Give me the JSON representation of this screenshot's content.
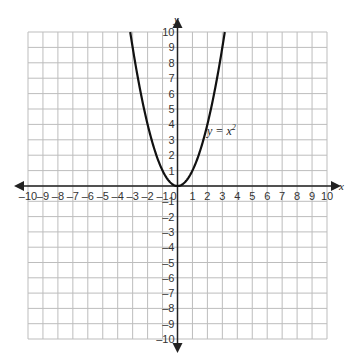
{
  "chart_data": {
    "type": "line",
    "title": "",
    "xlabel": "x",
    "ylabel": "y",
    "xlim": [
      -10,
      10
    ],
    "ylim": [
      -10,
      10
    ],
    "grid": true,
    "x_ticks": [
      -10,
      -9,
      -8,
      -7,
      -6,
      -5,
      -4,
      -3,
      -2,
      -1,
      0,
      1,
      2,
      3,
      4,
      5,
      6,
      7,
      8,
      9,
      10
    ],
    "y_ticks": [
      -10,
      -9,
      -8,
      -7,
      -6,
      -5,
      -4,
      -3,
      -2,
      -1,
      1,
      2,
      3,
      4,
      5,
      6,
      7,
      8,
      9,
      10
    ],
    "series": [
      {
        "name": "y = x^2",
        "x": [
          -3.16,
          -3,
          -2.5,
          -2,
          -1.5,
          -1,
          -0.5,
          0,
          0.5,
          1,
          1.5,
          2,
          2.5,
          3,
          3.16
        ],
        "y": [
          10,
          9,
          6.25,
          4,
          2.25,
          1,
          0.25,
          0,
          0.25,
          1,
          2.25,
          4,
          6.25,
          9,
          10
        ]
      }
    ],
    "annotations": [
      {
        "text": "y = x",
        "superscript": "2",
        "x": 2.2,
        "y": 6.3
      }
    ]
  },
  "labels": {
    "x_axis": "x",
    "y_axis": "y",
    "curve_label": "y = x",
    "curve_exp": "2"
  }
}
